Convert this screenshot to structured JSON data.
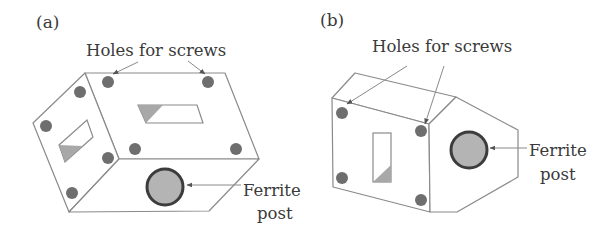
{
  "figure": {
    "panels": [
      {
        "id": "a",
        "label": "(a)",
        "holes_label": "Holes for screws",
        "ferrite_label_line1": "Ferrite",
        "ferrite_label_line2": "post"
      },
      {
        "id": "b",
        "label": "(b)",
        "holes_label": "Holes for screws",
        "ferrite_label_line1": "Ferrite",
        "ferrite_label_line2": "post"
      }
    ]
  },
  "colors": {
    "outline": "#8a8a8a",
    "hole_fill": "#6e6e6e",
    "slot_shade": "#a8a8a8",
    "ferrite_fill": "#b4b4b4",
    "ferrite_border": "#3c3c3c",
    "text": "#3a3a3a"
  }
}
